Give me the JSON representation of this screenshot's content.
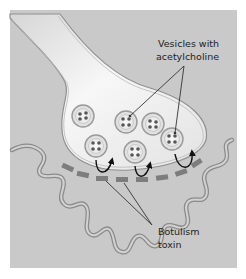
{
  "diagram": {
    "type": "neuromuscular junction illustration",
    "colors": {
      "background": "#c9c9c9",
      "terminal_fill": "#e8e8e8",
      "membrane": "#8a8a8a",
      "receptor": "#7d7d7d",
      "arrow": "#111111",
      "leader_line": "#333333"
    },
    "labels": {
      "vesicles_line1": "Vesicles with",
      "vesicles_line2": "acetylcholine",
      "toxin_line1": "Botulism",
      "toxin_line2": "toxin"
    },
    "vesicle_count": 6,
    "blocked_release_arrows": 3
  }
}
